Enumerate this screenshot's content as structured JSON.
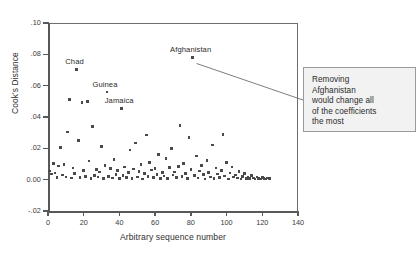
{
  "chart_data": {
    "type": "scatter",
    "title": "",
    "xlabel": "Arbitrary sequence number",
    "ylabel": "Cook's Distance",
    "xlim": [
      0,
      140
    ],
    "ylim": [
      -0.02,
      0.1
    ],
    "xticks": [
      0,
      20,
      40,
      60,
      80,
      100,
      120,
      140
    ],
    "xtick_labels": [
      "0",
      "20",
      "40",
      "60",
      "80",
      "100",
      "120",
      "140"
    ],
    "yticks": [
      -0.02,
      0.0,
      0.02,
      0.04,
      0.06,
      0.08,
      0.1
    ],
    "ytick_labels": [
      "-.02",
      "0.00",
      ".02",
      ".04",
      ".06",
      ".08",
      ".10"
    ],
    "grid": false,
    "legend": null,
    "marker": "square",
    "marker_color": "#4a4a4a",
    "series": [
      {
        "name": "Cook's Distance",
        "points": [
          [
            1,
            0.0055
          ],
          [
            2,
            0.0035
          ],
          [
            3,
            0.0105
          ],
          [
            4,
            0.0042
          ],
          [
            5,
            0.0012
          ],
          [
            6,
            0.0088
          ],
          [
            7,
            0.0205
          ],
          [
            8,
            0.003
          ],
          [
            9,
            0.0098
          ],
          [
            10,
            0.0018
          ],
          [
            11,
            0.0305
          ],
          [
            12,
            0.0512
          ],
          [
            13,
            0.001
          ],
          [
            14,
            0.0075
          ],
          [
            15,
            0.004
          ],
          [
            16,
            0.0705
          ],
          [
            17,
            0.025
          ],
          [
            18,
            0.0014
          ],
          [
            19,
            0.0492
          ],
          [
            20,
            0.006
          ],
          [
            21,
            0.0022
          ],
          [
            22,
            0.0498
          ],
          [
            23,
            0.0118
          ],
          [
            24,
            0.0008
          ],
          [
            25,
            0.034
          ],
          [
            26,
            0.0028
          ],
          [
            27,
            0.0065
          ],
          [
            28,
            0.0016
          ],
          [
            29,
            0.0048
          ],
          [
            30,
            0.021
          ],
          [
            31,
            0.0006
          ],
          [
            32,
            0.009
          ],
          [
            33,
            0.056
          ],
          [
            34,
            0.002
          ],
          [
            35,
            0.007
          ],
          [
            36,
            0.0011
          ],
          [
            37,
            0.0128
          ],
          [
            38,
            0.0032
          ],
          [
            39,
            0.0058
          ],
          [
            40,
            0.0009
          ],
          [
            41,
            0.0455
          ],
          [
            42,
            0.0025
          ],
          [
            43,
            0.0082
          ],
          [
            44,
            0.0013
          ],
          [
            45,
            0.0044
          ],
          [
            46,
            0.019
          ],
          [
            47,
            0.0007
          ],
          [
            48,
            0.0068
          ],
          [
            49,
            0.0235
          ],
          [
            50,
            0.0017
          ],
          [
            51,
            0.0052
          ],
          [
            52,
            0.0095
          ],
          [
            53,
            0.0005
          ],
          [
            54,
            0.0038
          ],
          [
            55,
            0.0285
          ],
          [
            56,
            0.0021
          ],
          [
            57,
            0.011
          ],
          [
            58,
            0.0062
          ],
          [
            59,
            0.0015
          ],
          [
            60,
            0.0072
          ],
          [
            61,
            0.0034
          ],
          [
            62,
            0.016
          ],
          [
            63,
            0.0009
          ],
          [
            64,
            0.0046
          ],
          [
            65,
            0.0024
          ],
          [
            66,
            0.0135
          ],
          [
            67,
            0.0006
          ],
          [
            68,
            0.0078
          ],
          [
            69,
            0.0198
          ],
          [
            70,
            0.0029
          ],
          [
            71,
            0.005
          ],
          [
            72,
            0.0012
          ],
          [
            73,
            0.0085
          ],
          [
            74,
            0.0345
          ],
          [
            75,
            0.0019
          ],
          [
            76,
            0.0102
          ],
          [
            77,
            0.0041
          ],
          [
            78,
            0.0008
          ],
          [
            79,
            0.027
          ],
          [
            80,
            0.0064
          ],
          [
            81,
            0.078
          ],
          [
            82,
            0.0026
          ],
          [
            83,
            0.015
          ],
          [
            84,
            0.001
          ],
          [
            85,
            0.0056
          ],
          [
            86,
            0.0092
          ],
          [
            87,
            0.0033
          ],
          [
            88,
            0.0004
          ],
          [
            89,
            0.0121
          ],
          [
            90,
            0.0047
          ],
          [
            91,
            0.0018
          ],
          [
            92,
            0.0222
          ],
          [
            93,
            0.0007
          ],
          [
            94,
            0.0074
          ],
          [
            95,
            0.0036
          ],
          [
            96,
            0.0013
          ],
          [
            97,
            0.0059
          ],
          [
            98,
            0.029
          ],
          [
            99,
            0.0023
          ],
          [
            100,
            0.0108
          ],
          [
            101,
            0.0005
          ],
          [
            102,
            0.0043
          ],
          [
            103,
            0.008
          ],
          [
            104,
            0.0016
          ],
          [
            105,
            0.0031
          ],
          [
            106,
            0.0011
          ],
          [
            107,
            0.0054
          ],
          [
            108,
            0.0003
          ],
          [
            109,
            0.002
          ],
          [
            110,
            0.0039
          ],
          [
            111,
            0.0008
          ],
          [
            112,
            0.0014
          ],
          [
            113,
            0.0006
          ],
          [
            114,
            0.0026
          ],
          [
            115,
            0.001
          ],
          [
            116,
            0.0004
          ],
          [
            117,
            0.0017
          ],
          [
            118,
            0.0009
          ],
          [
            119,
            0.0005
          ],
          [
            120,
            0.0012
          ],
          [
            121,
            0.0007
          ],
          [
            122,
            0.0003
          ],
          [
            123,
            0.0011
          ],
          [
            124,
            0.0006
          ]
        ]
      }
    ],
    "point_labels": [
      {
        "text": "Chad",
        "x": 16,
        "y": 0.0705
      },
      {
        "text": "Guinea",
        "x": 33,
        "y": 0.056
      },
      {
        "text": "Jamaica",
        "x": 41,
        "y": 0.0455
      },
      {
        "text": "Afghanistan",
        "x": 81,
        "y": 0.078
      }
    ],
    "annotations": [
      {
        "id": "afghanistan-callout",
        "text": "Removing Afghanistan would change all of the coefficients the most",
        "lines": [
          "Removing",
          "Afghanistan",
          "would change all",
          "of the coefficients",
          "the most"
        ],
        "target_x": 81,
        "target_y": 0.078,
        "box_bg": "#f2f2f2",
        "box_border": "#9a9a9a"
      }
    ]
  }
}
